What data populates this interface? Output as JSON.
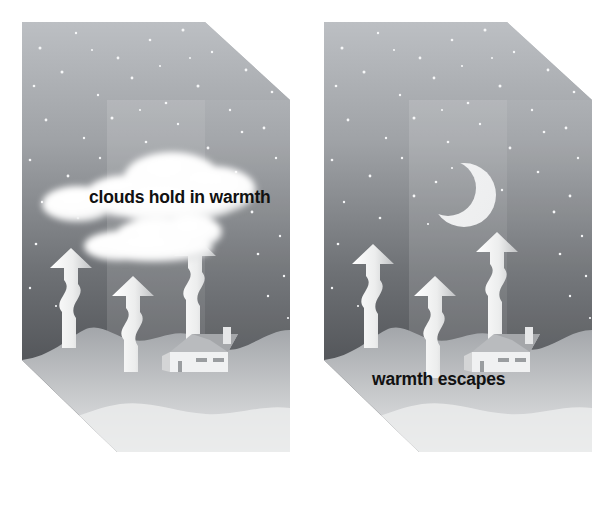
{
  "figure": {
    "type": "two-panel science illustration",
    "background_color": "#ffffff",
    "width": 604,
    "height": 529
  },
  "panels": [
    {
      "id": "cloudy-night",
      "position": "left",
      "caption": "clouds hold in warmth",
      "caption_color": "#111111",
      "sky": {
        "name": "night-sky",
        "gradient_top_color": "#b9bcc0",
        "gradient_bottom_color": "#3a3c40",
        "inner_band_tint": "#ffffff",
        "star_count": 64,
        "star_color": "#f6f7f8"
      },
      "ground": {
        "name": "ground-terrain",
        "top_color": "#a9acb0",
        "bottom_color": "#e4e5e6",
        "side_face_color": "#c9cbcd"
      },
      "clouds": {
        "count": 2,
        "color": "#ffffff",
        "shadow_color": "#8d9094"
      },
      "moon": {
        "visible": false
      },
      "arrows": {
        "name": "warmth-arrow",
        "count": 3,
        "color": "#f2f3f4",
        "direction": "up",
        "style": "wavy",
        "heights": [
          88,
          78,
          96
        ]
      },
      "house": {
        "name": "house",
        "wall_color": "#f0f1f2",
        "roof_color": "#b9bbbe",
        "chimney_color": "#e6e7e8"
      }
    },
    {
      "id": "clear-night",
      "position": "right",
      "caption": "warmth escapes",
      "caption_color": "#111111",
      "sky": {
        "name": "night-sky",
        "gradient_top_color": "#b9bcc0",
        "gradient_bottom_color": "#3a3c40",
        "inner_band_tint": "#ffffff",
        "star_count": 64,
        "star_color": "#f6f7f8"
      },
      "ground": {
        "name": "ground-terrain",
        "top_color": "#a9acb0",
        "bottom_color": "#e4e5e6",
        "side_face_color": "#c9cbcd"
      },
      "clouds": {
        "count": 0,
        "color": "#ffffff",
        "shadow_color": "#8d9094"
      },
      "moon": {
        "visible": true,
        "name": "crescent-moon",
        "color": "#f7f8f9",
        "phase": "waning crescent",
        "opening": "left"
      },
      "arrows": {
        "name": "warmth-arrow",
        "count": 3,
        "color": "#f2f3f4",
        "direction": "up",
        "style": "wavy",
        "heights": [
          96,
          86,
          104
        ]
      },
      "house": {
        "name": "house",
        "wall_color": "#f0f1f2",
        "roof_color": "#b9bbbe",
        "chimney_color": "#e6e7e8"
      }
    }
  ],
  "labels": {
    "left_caption": "clouds hold in warmth",
    "right_caption": "warmth escapes"
  }
}
